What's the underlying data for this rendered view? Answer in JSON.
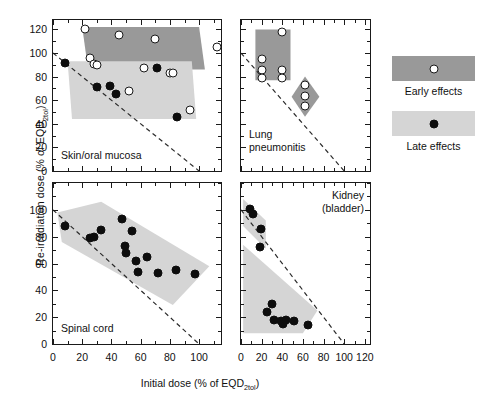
{
  "axes": {
    "ylabel_main": "Re-irradiation dose (% of EQD",
    "ylabel_sub": "2tol",
    "ylabel_tail": ")",
    "xlabel_main": "Initial dose (% of EQD",
    "xlabel_sub": "2tol",
    "xlabel_tail": ")"
  },
  "legend": {
    "early_label": "Early effects",
    "late_label": "Late effects",
    "early_color": "#999999",
    "late_color": "#d5d5d5"
  },
  "panels": {
    "skin": {
      "caption": "Skin/oral mucosa"
    },
    "lung": {
      "caption": "Lung\npneumonitis"
    },
    "spinal": {
      "caption": "Spinal cord"
    },
    "kidney": {
      "caption": "Kidney\n(bladder)"
    }
  },
  "chart_data": [
    {
      "type": "scatter",
      "id": "skin",
      "title": "Skin/oral mucosa",
      "xlabel": "Initial dose (% of EQD2tol)",
      "ylabel": "Re-irradiation dose (% of EQD2tol)",
      "xlim": [
        0,
        115
      ],
      "ylim": [
        0,
        128
      ],
      "xticks": [
        0,
        20,
        40,
        60,
        80,
        100
      ],
      "yticks": [
        0,
        20,
        40,
        60,
        80,
        100,
        120
      ],
      "grid": false,
      "reference_line": {
        "label": "iso-tolerance (total = 100%)",
        "style": "dashed",
        "x": [
          0,
          100
        ],
        "y": [
          100,
          0
        ]
      },
      "series": [
        {
          "name": "Early effects",
          "marker": "open-circle",
          "x": [
            22,
            25,
            28,
            30,
            45,
            52,
            62,
            70,
            80,
            82,
            94,
            112
          ],
          "y": [
            120,
            96,
            91,
            90,
            115,
            68,
            87,
            112,
            83,
            83,
            52,
            105
          ]
        },
        {
          "name": "Late effects",
          "marker": "filled-circle",
          "x": [
            8,
            30,
            39,
            43,
            71,
            85
          ],
          "y": [
            92,
            71,
            72,
            65,
            87,
            46
          ]
        }
      ],
      "shaded_bands": [
        {
          "name": "Early effects band",
          "color": "#999999",
          "polygon": [
            [
              20,
              122
            ],
            [
              100,
              122
            ],
            [
              104,
              86
            ],
            [
              24,
              86
            ]
          ]
        },
        {
          "name": "Late effects band",
          "color": "#d5d5d5",
          "polygon": [
            [
              10,
              93
            ],
            [
              95,
              93
            ],
            [
              98,
              44
            ],
            [
              13,
              44
            ]
          ]
        }
      ]
    },
    {
      "type": "scatter",
      "id": "lung",
      "title": "Lung pneumonitis",
      "xlim": [
        0,
        125
      ],
      "ylim": [
        0,
        128
      ],
      "xticks": [
        0,
        20,
        40,
        60,
        80,
        100,
        120
      ],
      "yticks": [
        0,
        20,
        40,
        60,
        80,
        100,
        120
      ],
      "grid": false,
      "reference_line": {
        "label": "iso-tolerance (total = 100%)",
        "style": "dashed",
        "x": [
          0,
          100
        ],
        "y": [
          100,
          0
        ]
      },
      "series": [
        {
          "name": "Early effects",
          "marker": "open-circle",
          "x": [
            20,
            20,
            20,
            40,
            40,
            40,
            62,
            62,
            62
          ],
          "y": [
            95,
            86,
            79,
            118,
            86,
            79,
            73,
            64,
            55
          ]
        }
      ],
      "shaded_bands": [
        {
          "name": "Early effects band (rectangle)",
          "color": "#999999",
          "polygon": [
            [
              14,
              120
            ],
            [
              48,
              120
            ],
            [
              48,
              77
            ],
            [
              14,
              77
            ]
          ]
        },
        {
          "name": "Early effects band (diamond)",
          "color": "#999999",
          "polygon": [
            [
              62,
              80
            ],
            [
              76,
              63
            ],
            [
              62,
              46
            ],
            [
              49,
              63
            ]
          ]
        }
      ]
    },
    {
      "type": "scatter",
      "id": "spinal",
      "title": "Spinal cord",
      "xlim": [
        0,
        115
      ],
      "ylim": [
        0,
        120
      ],
      "xticks": [
        0,
        20,
        40,
        60,
        80,
        100
      ],
      "yticks": [
        0,
        20,
        40,
        60,
        80,
        100
      ],
      "grid": false,
      "reference_line": {
        "label": "iso-tolerance (total = 100%)",
        "style": "dashed",
        "x": [
          0,
          100
        ],
        "y": [
          100,
          0
        ]
      },
      "series": [
        {
          "name": "Late effects",
          "marker": "filled-circle",
          "x": [
            8,
            25,
            28,
            33,
            47,
            49,
            50,
            54,
            57,
            58,
            64,
            72,
            84,
            97
          ],
          "y": [
            88,
            79,
            80,
            85,
            93,
            73,
            68,
            84,
            62,
            54,
            65,
            53,
            55,
            52
          ]
        }
      ],
      "shaded_bands": [
        {
          "name": "Late effects band",
          "color": "#d5d5d5",
          "polygon": [
            [
              3,
              98
            ],
            [
              33,
              106
            ],
            [
              107,
              58
            ],
            [
              82,
              29
            ],
            [
              6,
              76
            ]
          ]
        }
      ]
    },
    {
      "type": "scatter",
      "id": "kidney",
      "title": "Kidney (bladder)",
      "xlim": [
        0,
        125
      ],
      "ylim": [
        0,
        120
      ],
      "xticks": [
        0,
        20,
        40,
        60,
        80,
        100,
        120
      ],
      "yticks": [
        0,
        20,
        40,
        60,
        80,
        100
      ],
      "grid": false,
      "reference_line": {
        "label": "iso-tolerance (total = 100%)",
        "style": "dashed",
        "x": [
          0,
          100
        ],
        "y": [
          100,
          0
        ]
      },
      "series": [
        {
          "name": "Late effects",
          "marker": "filled-circle",
          "x": [
            9,
            12,
            19,
            18,
            30,
            25,
            32,
            39,
            41,
            44,
            51,
            65
          ],
          "y": [
            101,
            97,
            86,
            72,
            30,
            24,
            18,
            17,
            15,
            18,
            17,
            14
          ]
        }
      ],
      "shaded_bands": [
        {
          "name": "Late effects band (upper lobe)",
          "color": "#d5d5d5",
          "polygon": [
            [
              2,
              108
            ],
            [
              24,
              92
            ],
            [
              24,
              71
            ],
            [
              2,
              88
            ]
          ]
        },
        {
          "name": "Late effects band (lower lobe)",
          "color": "#d5d5d5",
          "polygon": [
            [
              2,
              74
            ],
            [
              2,
              8
            ],
            [
              60,
              8
            ],
            [
              74,
              25
            ]
          ]
        }
      ]
    }
  ]
}
